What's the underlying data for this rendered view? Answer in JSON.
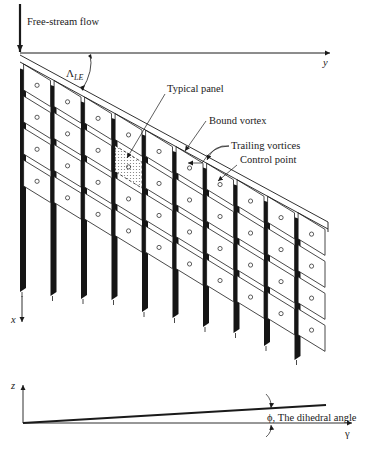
{
  "diagram": {
    "type": "vortex-lattice-method-swept-wing",
    "labels": {
      "free_stream": "Free-stream flow",
      "y_axis": "y",
      "x_axis": "x",
      "sweep_angle_main": "Λ",
      "sweep_angle_sub": "LE",
      "typical_panel": "Typical panel",
      "bound_vortex": "Bound vortex",
      "trailing_vortices": "Trailing vortices",
      "control_point": "Control point",
      "z_axis": "z",
      "y_axis_front": "γ",
      "dihedral": "ϕ, The dihedral angle"
    },
    "grid": {
      "spanwise_panels": 10,
      "chordwise_panels": 4
    },
    "colors": {
      "ink": "#1a1a1a",
      "vortex": "#151515",
      "panel_fill": "#ffffff",
      "typical_panel_fill": "#d8d8d8"
    }
  }
}
